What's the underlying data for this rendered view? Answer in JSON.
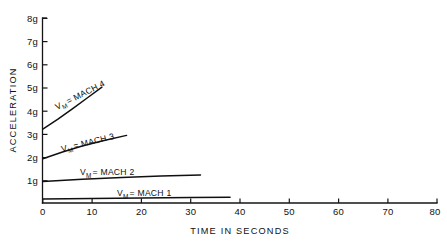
{
  "chart_data": {
    "type": "line",
    "title": "",
    "xlabel": "TIME IN SECONDS",
    "ylabel": "ACCELERATION",
    "xlim": [
      0,
      80
    ],
    "ylim": [
      0,
      8
    ],
    "grid": false,
    "legend_position": "inline-annotations",
    "xticks": [
      0,
      10,
      20,
      30,
      40,
      50,
      60,
      70,
      80
    ],
    "xtick_labels": [
      "0",
      "10",
      "20",
      "30",
      "40",
      "50",
      "60",
      "70",
      "80"
    ],
    "yticks": [
      1,
      2,
      3,
      4,
      5,
      6,
      7,
      8
    ],
    "ytick_labels": [
      "1g",
      "2g",
      "3g",
      "4g",
      "5g",
      "6g",
      "7g",
      "8g"
    ],
    "series": [
      {
        "name": "VM = MACH 4",
        "label_prefix": "V",
        "label_subscript": "M",
        "label_suffix": "= MACH 4",
        "label_rotation_deg": -27,
        "x": [
          0,
          3,
          6,
          9,
          12
        ],
        "y": [
          3.2,
          3.62,
          4.08,
          4.55,
          5.02
        ]
      },
      {
        "name": "VM = MACH 3",
        "label_prefix": "V",
        "label_subscript": "M",
        "label_suffix": "= MACH 3",
        "label_rotation_deg": -14,
        "x": [
          0,
          4,
          8,
          12,
          17
        ],
        "y": [
          1.92,
          2.21,
          2.47,
          2.69,
          2.93
        ]
      },
      {
        "name": "VM = MACH 2",
        "label_prefix": "V",
        "label_subscript": "M",
        "label_suffix": "= MACH 2",
        "label_rotation_deg": 0,
        "x": [
          0,
          8,
          16,
          24,
          32
        ],
        "y": [
          0.93,
          1.03,
          1.11,
          1.17,
          1.21
        ]
      },
      {
        "name": "VM = MACH 1",
        "label_prefix": "V",
        "label_subscript": "M",
        "label_suffix": "= MACH 1",
        "label_rotation_deg": 0,
        "x": [
          0,
          10,
          20,
          30,
          38
        ],
        "y": [
          0.17,
          0.2,
          0.22,
          0.24,
          0.25
        ]
      }
    ]
  },
  "axes": {
    "y_label": "ACCELERATION",
    "x_label": "TIME IN SECONDS"
  },
  "ytick_labels": {
    "t1": "1g",
    "t2": "2g",
    "t3": "3g",
    "t4": "4g",
    "t5": "5g",
    "t6": "6g",
    "t7": "7g",
    "t8": "8g"
  },
  "xtick_labels": {
    "t0": "0",
    "t10": "10",
    "t20": "20",
    "t30": "30",
    "t40": "40",
    "t50": "50",
    "t60": "60",
    "t70": "70",
    "t80": "80"
  },
  "series_labels": {
    "mach4": {
      "v": "V",
      "sub": "M",
      "rest": "= MACH 4"
    },
    "mach3": {
      "v": "V",
      "sub": "M",
      "rest": "= MACH 3"
    },
    "mach2": {
      "v": "V",
      "sub": "M",
      "rest": "= MACH 2"
    },
    "mach1": {
      "v": "V",
      "sub": "M",
      "rest": "= MACH 1"
    }
  },
  "colors": {
    "ink": "#111111",
    "background": "#ffffff"
  }
}
